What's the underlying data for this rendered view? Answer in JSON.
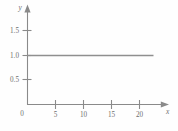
{
  "chart_data": {
    "type": "line",
    "title": "",
    "subtitle": "",
    "xlabel": "x",
    "ylabel": "y",
    "xlim": [
      0,
      23.5
    ],
    "ylim": [
      0,
      1.75
    ],
    "grid": false,
    "legend": null,
    "origin_label": "0",
    "xticks": [
      5,
      10,
      15,
      20
    ],
    "xtick_labels": [
      "5",
      "10",
      "15",
      "20"
    ],
    "yticks": [
      0.5,
      1.0,
      1.5
    ],
    "ytick_labels": [
      "0.5",
      "1.0",
      "1.5"
    ],
    "series": [
      {
        "name": "constant",
        "x": [
          0,
          22.5
        ],
        "values": [
          1.0,
          1.0
        ],
        "color": "#8f8f8f"
      }
    ],
    "annotations": [],
    "axis_color": "#8a8a8a",
    "text_color": "#6e6e6e",
    "background": "#fefefe"
  },
  "axes": {
    "y_axis_name": "y",
    "x_axis_name": "x",
    "origin": "0"
  },
  "ytick_items": [
    {
      "label": "1.5",
      "value": 1.5
    },
    {
      "label": "1.0",
      "value": 1.0
    },
    {
      "label": "0.5",
      "value": 0.5
    }
  ],
  "xtick_items": [
    {
      "label": "5",
      "value": 5
    },
    {
      "label": "10",
      "value": 10
    },
    {
      "label": "15",
      "value": 15
    },
    {
      "label": "20",
      "value": 20
    }
  ]
}
